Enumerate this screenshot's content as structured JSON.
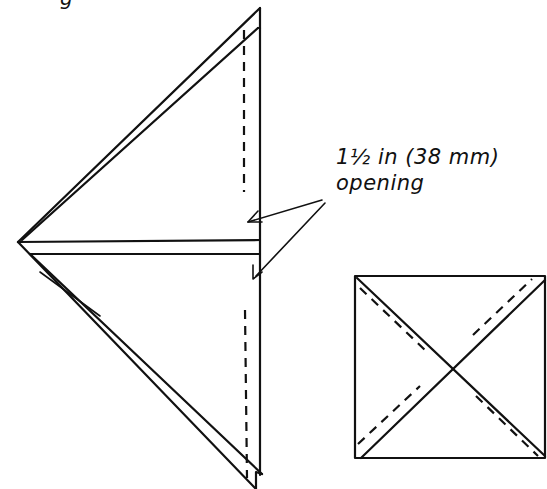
{
  "annotation": {
    "line1": "1½ in (38 mm)",
    "line2": "opening"
  },
  "top_fragment": "g",
  "colors": {
    "ink": "#111111",
    "paper": "#ffffff"
  },
  "figures": [
    {
      "name": "folded-triangle-bag",
      "apex": [
        18,
        242
      ],
      "right_edge_x": 260,
      "top_y": 10,
      "bottom_y": 489,
      "dashed_fold_x": 244,
      "center_band_y": [
        238,
        252
      ]
    },
    {
      "name": "square-with-diagonals",
      "x": 355,
      "y": 276,
      "width": 190,
      "height": 182,
      "diagonals": "solid X with parallel dashed offset lines"
    }
  ]
}
